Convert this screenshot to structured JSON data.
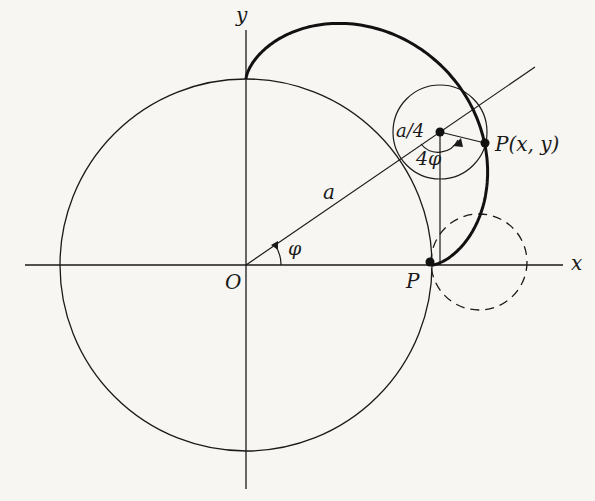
{
  "diagram": {
    "origin": {
      "x": 246,
      "y": 265
    },
    "a_px": 186,
    "rolling_radius_ratio": 0.25,
    "phi_deg_shown": 31,
    "curve_range_deg": [
      0,
      90
    ],
    "colors": {
      "ink": "#1a1a1a",
      "background": "#f7f6f2"
    }
  },
  "labels": {
    "x_axis": "x",
    "y_axis": "y",
    "origin": "O",
    "radius": "a",
    "angle": "φ",
    "small_radius": "a/4",
    "rolled_angle": "4φ",
    "point_general": "P(x, y)",
    "point_start": "P"
  }
}
